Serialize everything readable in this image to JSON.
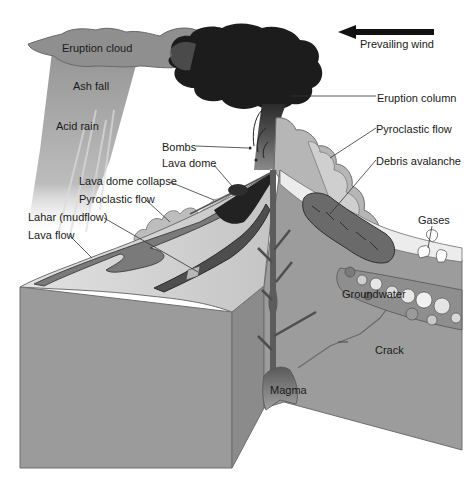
{
  "diagram": {
    "colors": {
      "background": "#ffffff",
      "eruption_column_dark": "#1c1c1c",
      "eruption_cloud": "#8e8e8e",
      "ash_fall": "#9a9a9a",
      "block_front": "#9b9b9b",
      "block_side": "#8a8a8a",
      "surface_light": "#d6d6d6",
      "pyroclastic_cloud": "#b8b8b8",
      "flows_dark": "#5a5a5a",
      "magma": "#7c7c7c",
      "label_text": "#1a1a1a"
    },
    "wind": {
      "label": "Prevailing wind",
      "arrow_direction": "left"
    },
    "labels": {
      "eruption_cloud": "Eruption cloud",
      "ash_fall": "Ash fall",
      "acid_rain": "Acid rain",
      "eruption_column": "Eruption column",
      "bombs": "Bombs",
      "lava_dome": "Lava dome",
      "pyroclastic_flow_right": "Pyroclastic flow",
      "debris_avalanche": "Debris avalanche",
      "lava_dome_collapse": "Lava dome collapse",
      "pyroclastic_flow_left": "Pyroclastic flow",
      "lahar": "Lahar (mudflow)",
      "lava_flow": "Lava flow",
      "gases": "Gases",
      "groundwater": "Groundwater",
      "crack": "Crack",
      "magma": "Magma"
    }
  }
}
